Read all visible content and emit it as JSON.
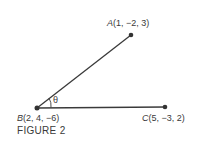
{
  "figure": {
    "caption": "FIGURE 2",
    "angle_label": "θ",
    "points": [
      {
        "name": "A",
        "coords": "(1, −2, 3)"
      },
      {
        "name": "B",
        "coords": "(2, 4, −6)"
      },
      {
        "name": "C",
        "coords": "(5, −3, 2)"
      }
    ]
  }
}
